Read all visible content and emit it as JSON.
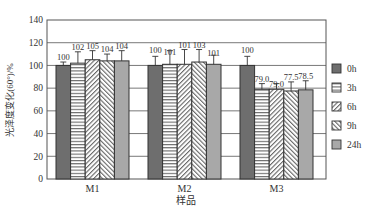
{
  "chart_data": {
    "type": "bar",
    "title": "",
    "xlabel": "样品",
    "ylabel": "光泽度变化(60°)/%",
    "ylim": [
      0,
      140
    ],
    "yticks": [
      0,
      20,
      40,
      60,
      80,
      100,
      120,
      140
    ],
    "grid": true,
    "legend_position": "right",
    "categories": [
      "M1",
      "M2",
      "M3"
    ],
    "series": [
      {
        "name": "0h",
        "values": [
          100,
          100,
          100
        ],
        "labels": [
          "100",
          "100",
          "100"
        ],
        "errors": [
          3,
          8,
          8
        ],
        "pattern": "solid-dark"
      },
      {
        "name": "3h",
        "values": [
          102,
          101,
          79.0
        ],
        "labels": [
          "102",
          "101",
          "79.0"
        ],
        "errors": [
          10,
          12,
          5
        ],
        "pattern": "horizontal"
      },
      {
        "name": "6h",
        "values": [
          105,
          101,
          79.0
        ],
        "labels": [
          "105",
          "101",
          "79.0"
        ],
        "errors": [
          8,
          13,
          5
        ],
        "pattern": "diag-right"
      },
      {
        "name": "9h",
        "values": [
          104,
          103,
          77.5
        ],
        "labels": [
          "104",
          "103",
          "77.5"
        ],
        "errors": [
          6,
          11,
          8
        ],
        "pattern": "diag-left"
      },
      {
        "name": "24h",
        "values": [
          104,
          101,
          78.5
        ],
        "labels": [
          "104",
          "101",
          "78.5"
        ],
        "errors": [
          9,
          8,
          8
        ],
        "pattern": "solid-light"
      }
    ]
  },
  "colors": {
    "dark": "#6e6e6e",
    "light": "#a8a8a8",
    "line": "#333333",
    "grid": "#555555"
  }
}
